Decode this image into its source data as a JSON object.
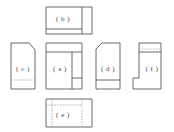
{
  "figure": {
    "type": "orthographic-multiview-drawing",
    "background_color": "#ffffff",
    "solid_line_color": "#5a5a5a",
    "hidden_line_color": "#9a9a9a",
    "label_color": "#3a3a3a",
    "canvas": {
      "width": 174,
      "height": 132
    }
  },
  "views": [
    {
      "id": "b",
      "label": "( b )",
      "position": "top-center",
      "label_x": 63,
      "label_y": 19,
      "box": {
        "x": 46,
        "y": 7,
        "width": 46,
        "height": 27
      },
      "outline": "M46,7 L92,7 L92,34 L46,34 Z",
      "solid_lines": [
        "M46,29 L82,29",
        "M82,7 L82,34"
      ],
      "hidden_lines": []
    },
    {
      "id": "c",
      "label": "( c )",
      "position": "middle-left",
      "label_x": 23,
      "label_y": 69,
      "box": {
        "x": 11,
        "y": 43,
        "width": 24,
        "height": 46
      },
      "outline": "M11,43 L29,43 L35,50 L35,89 L11,89 Z",
      "solid_lines": [],
      "hidden_lines": [
        "M11,80 L35,80"
      ]
    },
    {
      "id": "a",
      "label": "( a )",
      "position": "middle-center",
      "label_x": 60,
      "label_y": 69,
      "box": {
        "x": 46,
        "y": 43,
        "width": 36,
        "height": 46
      },
      "outline": "M46,43 L82,43 L82,43 L82,78 L82,78 L82,89 L46,89 Z",
      "solid_lines": [
        "M46,52 L82,52",
        "M72,52 L72,89",
        "M72,78 L82,78"
      ],
      "hidden_lines": []
    },
    {
      "id": "d",
      "label": "( d )",
      "position": "middle-right",
      "label_x": 108,
      "label_y": 69,
      "box": {
        "x": 96,
        "y": 43,
        "width": 24,
        "height": 46
      },
      "outline": "M102,43 L120,43 L120,89 L96,89 L96,49 Z",
      "solid_lines": [
        "M96,80 L120,80"
      ],
      "hidden_lines": []
    },
    {
      "id": "f",
      "label": "( f )",
      "position": "middle-far-right",
      "label_x": 152,
      "label_y": 69,
      "box": {
        "x": 133,
        "y": 43,
        "width": 28,
        "height": 46
      },
      "outline": "M139,43 L161,43 L161,89 L133,89 L133,78 L139,78 Z",
      "solid_lines": [
        "M139,52 L161,52"
      ],
      "hidden_lines": [
        "M139,49 L161,49"
      ]
    },
    {
      "id": "e",
      "label": "( e )",
      "position": "bottom-center",
      "label_x": 63,
      "label_y": 115,
      "box": {
        "x": 46,
        "y": 99,
        "width": 46,
        "height": 28
      },
      "outline": "M46,99 L92,99 L92,127 L46,127 Z",
      "solid_lines": [],
      "hidden_lines": [
        "M46,105 L82,105",
        "M82,99 L82,127",
        "M52,99 L52,127"
      ]
    }
  ]
}
